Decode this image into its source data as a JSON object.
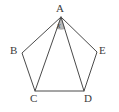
{
  "figure": {
    "shape": "pentagon",
    "stroke_color": "#4a4a4a",
    "fill_color": "#ffffff",
    "angle_marker_fill": "#b9b9b9",
    "label_color": "#3b3b3b",
    "background_color": "#ffffff",
    "vertices": [
      {
        "id": "A",
        "label": "A",
        "x": 61,
        "y": 17
      },
      {
        "id": "B",
        "label": "B",
        "x": 22,
        "y": 53
      },
      {
        "id": "C",
        "label": "C",
        "x": 35,
        "y": 91
      },
      {
        "id": "D",
        "label": "D",
        "x": 84,
        "y": 91
      },
      {
        "id": "E",
        "label": "E",
        "x": 97,
        "y": 52
      }
    ],
    "edges": [
      {
        "from": "A",
        "to": "B"
      },
      {
        "from": "B",
        "to": "C"
      },
      {
        "from": "C",
        "to": "D"
      },
      {
        "from": "D",
        "to": "E"
      },
      {
        "from": "E",
        "to": "A"
      }
    ],
    "diagonals": [
      {
        "from": "A",
        "to": "C"
      },
      {
        "from": "A",
        "to": "D"
      }
    ],
    "angle_marker": {
      "at_vertex": "A",
      "between": [
        "C",
        "D"
      ],
      "label": "x",
      "shaded": true
    }
  }
}
